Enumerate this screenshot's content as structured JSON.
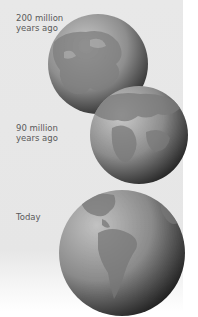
{
  "diagram": {
    "stages": [
      {
        "label_line1": "200 million",
        "label_line2": "years ago"
      },
      {
        "label_line1": "90 million",
        "label_line2": "years ago"
      },
      {
        "label_line1": "Today",
        "label_line2": ""
      }
    ]
  },
  "colors": {
    "panel": "#e7e7e7",
    "globe_light": "#bdbdbd",
    "globe_dark": "#2e2e2e",
    "land": "#8a8a8a",
    "text": "#5a5a5a"
  }
}
